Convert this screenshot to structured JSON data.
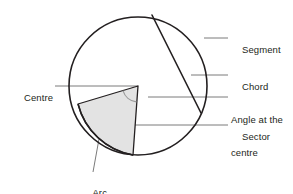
{
  "diagram": {
    "colors": {
      "outline": "#231f20",
      "sector_fill": "#e3e3e3",
      "sector_stroke": "#231f20",
      "leader_line": "#7b7b7b",
      "angle_arc": "#9a9a9a",
      "text": "#231f20",
      "background": "#ffffff"
    },
    "geometry": {
      "circle_center": [
        138,
        86
      ],
      "circle_radius": 69,
      "chord_start": [
        152,
        15
      ],
      "chord_end": [
        201,
        113
      ],
      "sector_arm_a_end": [
        78,
        104
      ],
      "sector_arm_b_end": [
        133,
        155
      ],
      "angle_marker_radius": 16
    },
    "labels": [
      {
        "key": "centre",
        "text": "Centre",
        "lines": [
          "Centre"
        ],
        "align": "right",
        "text_x": 13,
        "text_y": 81,
        "leader": {
          "x1": 55,
          "y1": 86,
          "x2": 138,
          "y2": 86
        }
      },
      {
        "key": "segment",
        "text": "Segment",
        "lines": [
          "Segment"
        ],
        "align": "left",
        "text_x": 231,
        "text_y": 33,
        "leader": {
          "x1": 204,
          "y1": 38,
          "x2": 228,
          "y2": 38
        }
      },
      {
        "key": "chord",
        "text": "Chord",
        "lines": [
          "Chord"
        ],
        "align": "left",
        "text_x": 231,
        "text_y": 70,
        "leader": {
          "x1": 191,
          "y1": 75,
          "x2": 228,
          "y2": 75
        }
      },
      {
        "key": "angle-at-the-centre",
        "text": "Angle at the centre",
        "lines": [
          "Angle at the",
          "centre"
        ],
        "align": "left",
        "text_x": 231,
        "text_y": 92,
        "leader": {
          "x1": 148,
          "y1": 97,
          "x2": 228,
          "y2": 97
        }
      },
      {
        "key": "sector",
        "text": "Sector",
        "lines": [
          "Sector"
        ],
        "align": "left",
        "text_x": 231,
        "text_y": 120,
        "leader": {
          "x1": 118,
          "y1": 125,
          "x2": 228,
          "y2": 125
        }
      },
      {
        "key": "arc",
        "text": "Arc",
        "lines": [
          "Arc"
        ],
        "align": "center",
        "text_x": 95,
        "text_y": 178,
        "leader": {
          "x1": 99,
          "y1": 139,
          "x2": 93,
          "y2": 172
        }
      }
    ]
  }
}
